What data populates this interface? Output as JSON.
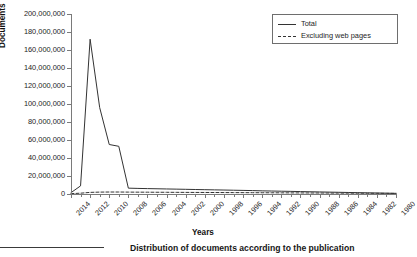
{
  "figure": {
    "caption": "Distribution of documents according to the publication",
    "caption_truncated": true
  },
  "axes": {
    "y_title": "Documents",
    "x_title": "Years"
  },
  "legend": {
    "position": "top-right",
    "entries": [
      {
        "label": "Total",
        "style": "solid",
        "color": "#333333"
      },
      {
        "label": "Excluding web pages",
        "style": "dashed",
        "color": "#333333"
      }
    ]
  },
  "chart_data": {
    "type": "line",
    "title": "",
    "xlabel": "Years",
    "ylabel": "Documents",
    "ylim": [
      0,
      200000000
    ],
    "ytick_labels": [
      "0",
      "20,000,000",
      "40,000,000",
      "60,000,000",
      "80,000,000",
      "100,000,000",
      "120,000,000",
      "140,000,000",
      "160,000,000",
      "180,000,000",
      "200,000,000"
    ],
    "ytick_values": [
      0,
      20000000,
      40000000,
      60000000,
      80000000,
      100000000,
      120000000,
      140000000,
      160000000,
      180000000,
      200000000
    ],
    "grid": false,
    "x_order": "descending",
    "xtick_labels": [
      "2014",
      "2012",
      "2010",
      "2008",
      "2006",
      "2004",
      "2002",
      "2000",
      "1998",
      "1996",
      "1994",
      "1992",
      "1990",
      "1988",
      "1986",
      "1984",
      "1982",
      "1980"
    ],
    "x": [
      2014,
      2013,
      2012,
      2011,
      2010,
      2009,
      2008,
      2007,
      2006,
      2005,
      2004,
      2003,
      2002,
      2001,
      2000,
      1999,
      1998,
      1997,
      1996,
      1995,
      1994,
      1993,
      1992,
      1991,
      1990,
      1989,
      1988,
      1987,
      1986,
      1985,
      1984,
      1983,
      1982,
      1981,
      1980
    ],
    "series": [
      {
        "name": "Total",
        "style": "solid",
        "color": "#333333",
        "values": [
          1500000,
          9000000,
          172000000,
          96000000,
          55000000,
          53000000,
          6500000,
          6200000,
          6000000,
          5800000,
          5600000,
          5400000,
          5200000,
          5000000,
          4800000,
          4600000,
          4400000,
          4200000,
          4000000,
          3800000,
          3500000,
          3300000,
          3100000,
          2900000,
          2700000,
          2500000,
          2300000,
          2100000,
          1900000,
          1700000,
          1500000,
          1300000,
          1100000,
          900000,
          700000
        ]
      },
      {
        "name": "Excluding web pages",
        "style": "dashed",
        "color": "#333333",
        "values": [
          400000,
          900000,
          1800000,
          2100000,
          2200000,
          2200000,
          2100000,
          2050000,
          2000000,
          1950000,
          1900000,
          1850000,
          1800000,
          1750000,
          1700000,
          1650000,
          1600000,
          1550000,
          1500000,
          1450000,
          1400000,
          1350000,
          1300000,
          1250000,
          1200000,
          1150000,
          1100000,
          1050000,
          1000000,
          950000,
          900000,
          850000,
          800000,
          750000,
          700000
        ]
      }
    ]
  }
}
